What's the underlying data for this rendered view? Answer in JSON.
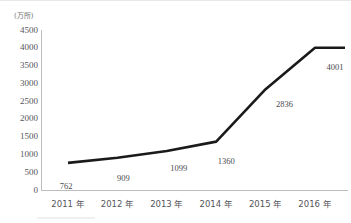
{
  "chart_data": {
    "type": "line",
    "title": "",
    "subtitle": "",
    "xlabel": "",
    "ylabel": "",
    "unit_label": "(万所)",
    "categories": [
      "2011 年",
      "2012 年",
      "2013 年",
      "2014 年",
      "2015 年",
      "2016 年"
    ],
    "x": [
      2011,
      2012,
      2013,
      2014,
      2015,
      2016
    ],
    "values": [
      762,
      909,
      1099,
      1360,
      2836,
      4001
    ],
    "data_labels": [
      "762",
      "909",
      "1099",
      "1360",
      "2836",
      "4001"
    ],
    "ylim": [
      0,
      4500
    ],
    "y_ticks": [
      0,
      500,
      1000,
      1500,
      2000,
      2500,
      3000,
      3500,
      4000,
      4500
    ],
    "y_tick_labels": [
      "0",
      "500",
      "1000",
      "1500",
      "2000",
      "2500",
      "3000",
      "3500",
      "4000",
      "4500"
    ],
    "grid": false,
    "legend": false,
    "legend_position": "none",
    "series": [
      {
        "name": "",
        "values": [
          762,
          909,
          1099,
          1360,
          2836,
          4001
        ],
        "color": "#1a1a1a",
        "line_width": 2.6,
        "markers": false
      }
    ],
    "annotations": [
      {
        "text": "plateau",
        "description": "line continues flat to the right of the 2016 data point"
      }
    ]
  },
  "colors": {
    "line": "#1a1a1a",
    "axis": "#bdbdbd",
    "tick_text": "#55555a",
    "value_text": "#4a4a4f",
    "unit_text": "#6f6f6f",
    "background": "#ffffff"
  }
}
